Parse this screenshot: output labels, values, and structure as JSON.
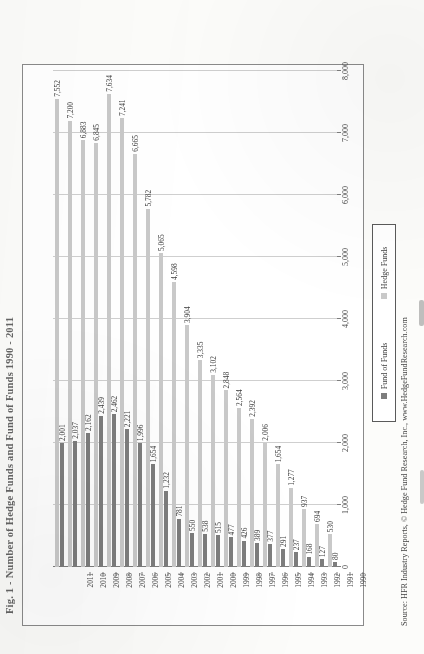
{
  "figure": {
    "title": "Fig. 1 - Number of Hedge Funds and Fund of Funds 1990 - 2011",
    "source": "Source:  HFR Industry Reports, © Hedge Fund Research, Inc., www.HedgeFundResearch.com"
  },
  "legend": {
    "items": [
      {
        "label": "Fund of Funds",
        "color": "#7d7d7d"
      },
      {
        "label": "Hedge Funds",
        "color": "#c9c9c9"
      }
    ]
  },
  "chart_data": {
    "type": "bar",
    "orientation": "horizontal",
    "title": "Fig. 1 - Number of Hedge Funds and Fund of Funds 1990 - 2011",
    "xlabel": "",
    "ylabel": "",
    "xlim": [
      0,
      8000
    ],
    "xticks": [
      0,
      1000,
      2000,
      3000,
      4000,
      5000,
      6000,
      7000,
      8000
    ],
    "xticklabels": [
      "0",
      "1,000",
      "2,000",
      "3,000",
      "4,000",
      "5,000",
      "6,000",
      "7,000",
      "8,000"
    ],
    "grid": true,
    "legend_position": "bottom-center",
    "categories": [
      "1990",
      "1991",
      "1992",
      "1993",
      "1994",
      "1995",
      "1996",
      "1997",
      "1998",
      "1999",
      "2000",
      "2001",
      "2002",
      "2003",
      "2004",
      "2005",
      "2006",
      "2007",
      "2008",
      "2009",
      "2010",
      "2011"
    ],
    "series": [
      {
        "name": "Hedge Funds",
        "color": "#c9c9c9",
        "values": [
          530,
          694,
          937,
          1277,
          1654,
          2006,
          2392,
          2564,
          2848,
          3102,
          3335,
          3904,
          4598,
          5065,
          5782,
          6665,
          7241,
          7634,
          6845,
          6883,
          7200,
          7552
        ],
        "labels": [
          "530",
          "694",
          "937",
          "1,277",
          "1,654",
          "2,006",
          "2,392",
          "2,564",
          "2,848",
          "3,102",
          "3,335",
          "3,904",
          "4,598",
          "5,065",
          "5,782",
          "6,665",
          "7,241",
          "7,634",
          "6,845",
          "6,883",
          "7,200",
          "7,552"
        ]
      },
      {
        "name": "Fund of Funds",
        "color": "#7d7d7d",
        "values": [
          80,
          127,
          168,
          237,
          291,
          377,
          389,
          426,
          477,
          515,
          538,
          550,
          781,
          1232,
          1654,
          1996,
          2221,
          2462,
          2439,
          2162,
          2037,
          2001
        ],
        "labels": [
          "80",
          "127",
          "168",
          "237",
          "291",
          "377",
          "389",
          "426",
          "477",
          "515",
          "538",
          "550",
          "781",
          "1,232",
          "1,654",
          "1,996",
          "2,221",
          "2,462",
          "2,439",
          "2,162",
          "2,037",
          "2,001"
        ]
      }
    ]
  }
}
